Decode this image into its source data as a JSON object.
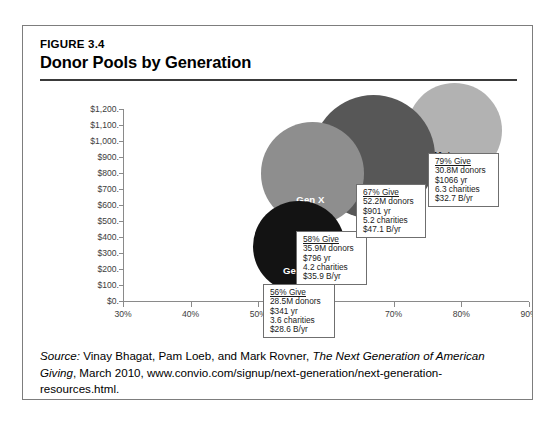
{
  "figure": {
    "label": "FIGURE 3.4",
    "title": "Donor Pools by Generation"
  },
  "source": {
    "prefix": "Source:",
    "authors": " Vinay Bhagat, Pam Loeb, and Mark Rovner, ",
    "work": "The Next Generation of American Giving",
    "rest": ", March 2010, www.convio.com/signup/next-generation/next-generation-resources.html."
  },
  "chart_data": {
    "type": "scatter",
    "title": "Donor Pools by Generation",
    "xlabel": "",
    "ylabel": "",
    "xlim": [
      30,
      90
    ],
    "ylim": [
      0,
      1200
    ],
    "grid": false,
    "legend": "none",
    "x_ticks": [
      "30%",
      "40%",
      "50%",
      "60%",
      "70%",
      "80%",
      "90%"
    ],
    "y_ticks": [
      "$0.",
      "$100.",
      "$200.",
      "$300.",
      "$400.",
      "$500.",
      "$600.",
      "$700.",
      "$800.",
      "$900.",
      "$1,000.",
      "$1,100.",
      "$1,200."
    ],
    "note": "Bubble chart: x = percent who give, y = dollars given per year, bubble area = donor pool size",
    "points": [
      {
        "name": "Gen Y",
        "x": 56,
        "y": 341,
        "donors_millions": 28.5,
        "color": "#131313",
        "label_color": "#ffffff",
        "callout": {
          "pct": "56% Give",
          "donors": "28.5M donors",
          "per_year": "$341 yr",
          "charities": "3.6 charities",
          "total": "$28.6 B/yr"
        }
      },
      {
        "name": "Gen X",
        "x": 58,
        "y": 796,
        "donors_millions": 35.9,
        "color": "#8e8e8e",
        "label_color": "#ffffff",
        "callout": {
          "pct": "58% Give",
          "donors": "35.9M donors",
          "per_year": "$796 yr",
          "charities": "4.2 charities",
          "total": "$35.9 B/yr"
        }
      },
      {
        "name": "Boomers",
        "x": 67,
        "y": 901,
        "donors_millions": 52.2,
        "color": "#575757",
        "label_color": "#ffffff",
        "callout": {
          "pct": "67% Give",
          "donors": "52.2M donors",
          "per_year": "$901 yr",
          "charities": "5.2 charities",
          "total": "$47.1 B/yr"
        }
      },
      {
        "name": "Matures",
        "x": 79,
        "y": 1066,
        "donors_millions": 30.8,
        "color": "#b2b2b2",
        "label_color": "#1a1a1a",
        "callout": {
          "pct": "79% Give",
          "donors": "30.8M donors",
          "per_year": "$1066 yr",
          "charities": "6.3 charities",
          "total": "$32.7 B/yr"
        }
      }
    ]
  }
}
